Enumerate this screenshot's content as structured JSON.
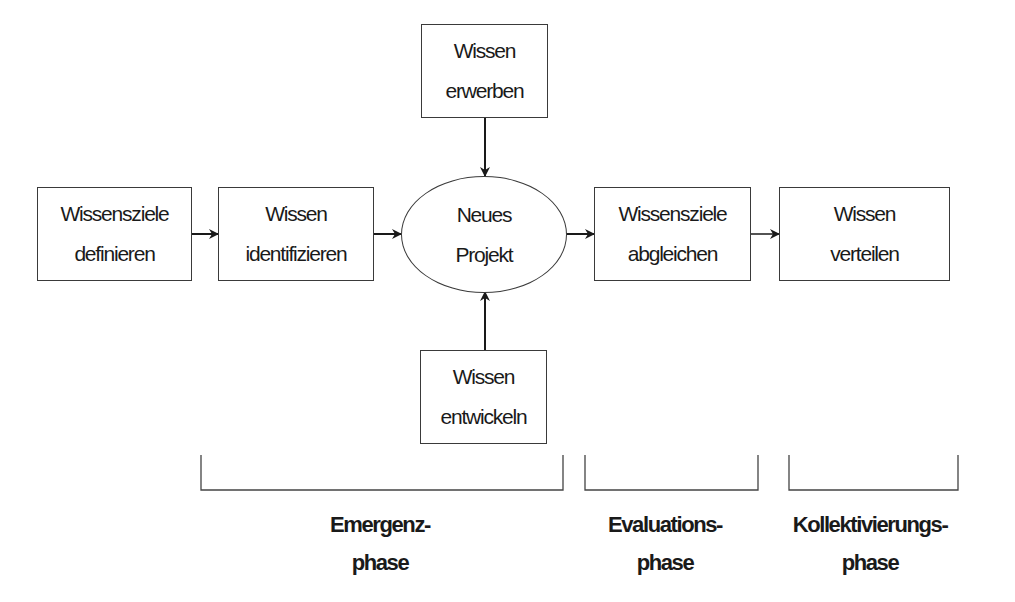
{
  "diagram": {
    "nodes": {
      "wissensziele_definieren": {
        "line1": "Wissensziele",
        "line2": "definieren"
      },
      "wissen_identifizieren": {
        "line1": "Wissen",
        "line2": "identifizieren"
      },
      "neues_projekt": {
        "line1": "Neues",
        "line2": "Projekt"
      },
      "wissen_erwerben": {
        "line1": "Wissen",
        "line2": "erwerben"
      },
      "wissen_entwickeln": {
        "line1": "Wissen",
        "line2": "entwickeln"
      },
      "wissensziele_abgleichen": {
        "line1": "Wissensziele",
        "line2": "abgleichen"
      },
      "wissen_verteilen": {
        "line1": "Wissen",
        "line2": "verteilen"
      }
    },
    "edges": [
      {
        "from": "wissensziele_definieren",
        "to": "wissen_identifizieren"
      },
      {
        "from": "wissen_identifizieren",
        "to": "neues_projekt"
      },
      {
        "from": "wissen_erwerben",
        "to": "neues_projekt"
      },
      {
        "from": "wissen_entwickeln",
        "to": "neues_projekt"
      },
      {
        "from": "neues_projekt",
        "to": "wissensziele_abgleichen"
      },
      {
        "from": "wissensziele_abgleichen",
        "to": "wissen_verteilen"
      }
    ],
    "phases": {
      "emergenz": {
        "line1": "Emergenz-",
        "line2": "phase"
      },
      "evaluation": {
        "line1": "Evaluations-",
        "line2": "phase"
      },
      "kollektivierung": {
        "line1": "Kollektivierungs-",
        "line2": "phase"
      }
    }
  }
}
